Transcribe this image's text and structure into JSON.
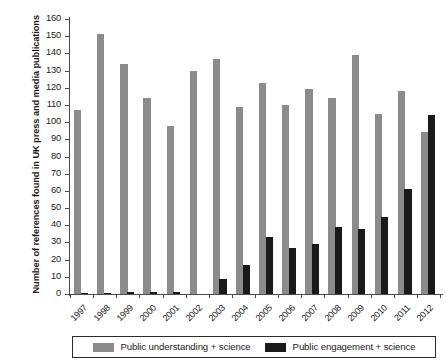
{
  "chart_data": {
    "type": "bar",
    "title": "",
    "xlabel": "",
    "ylabel": "Number of references found in UK press and media publications",
    "ylim": [
      0,
      160
    ],
    "ytick_step": 10,
    "grid": false,
    "legend_position": "bottom",
    "categories": [
      "1997",
      "1998",
      "1999",
      "2000",
      "2001",
      "2002",
      "2003",
      "2004",
      "2005",
      "2006",
      "2007",
      "2008",
      "2009",
      "2010",
      "2011",
      "2012"
    ],
    "ytick_labels": [
      "0",
      "10",
      "20",
      "30",
      "40",
      "50",
      "60",
      "70",
      "80",
      "90",
      "100",
      "110",
      "120",
      "130",
      "140",
      "150",
      "160"
    ],
    "series": [
      {
        "name": "Public understanding + science",
        "color": "#8b8b8b",
        "values": [
          107,
          151,
          134,
          114,
          98,
          130,
          137,
          109,
          123,
          110,
          119,
          114,
          139,
          105,
          118,
          94
        ]
      },
      {
        "name": "Public engagement + science",
        "color": "#1a1a1a",
        "values": [
          0.5,
          0.5,
          1,
          1,
          1,
          0,
          9,
          17,
          33,
          27,
          29,
          39,
          38,
          45,
          61,
          104
        ]
      }
    ]
  },
  "legend": {
    "items": [
      {
        "label": "Public understanding + science",
        "swatch": "g"
      },
      {
        "label": "Public engagement + science",
        "swatch": "k"
      }
    ]
  }
}
